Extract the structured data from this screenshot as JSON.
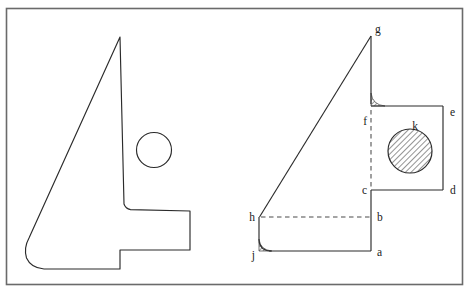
{
  "figure": {
    "kind": "engineering-drawing",
    "title": "",
    "caption": "",
    "frame": {
      "stroke": "#555555",
      "x": 6,
      "y": 8,
      "width": 457,
      "height": 277
    },
    "line_color": "#2b2b2b",
    "hatch_color": "#3a3a3a",
    "background": "#ffffff"
  },
  "pictorial_view": {
    "name": "left-isometric-part",
    "outline_points": "120,37 124,204 129,208 137,210 190,211 190,250 120,250 120,269 44,269 34,266 27,258 25,248 25,238 31,229",
    "hole": {
      "label": "",
      "cx": 154,
      "cy": 150,
      "r": 17,
      "filled": false
    }
  },
  "orthographic_view": {
    "name": "right-profile-view",
    "solid_outline_points": "371,36 371,106 443,106 443,190 371,190 371,251 271,251",
    "ramp_points": "371,36 259,218",
    "dashed_vertical": {
      "x": 371,
      "y1": 106,
      "y2": 190
    },
    "dashed_horizontal": {
      "y": 217,
      "x1": 259,
      "x2": 371
    },
    "left_wall": {
      "x": 259,
      "y1": 217,
      "y2": 243
    },
    "bottom_edge": {
      "y": 251,
      "x1": 271,
      "x2": 371
    },
    "hole": {
      "cx": 410,
      "cy": 151,
      "r": 22,
      "filled": true,
      "fill_pattern": "diagonal-hatch"
    },
    "fillets": [
      {
        "name": "fillet-f",
        "corner_x": 371,
        "corner_y": 106,
        "radius": 13,
        "sweep": "upper-left",
        "hatched": true
      },
      {
        "name": "fillet-j",
        "corner_x": 259,
        "corner_y": 251,
        "radius": 12,
        "sweep": "lower-left",
        "hatched": true
      }
    ],
    "labels": [
      {
        "id": "g",
        "text": "g",
        "x": 375,
        "y": 33,
        "anchor": "start"
      },
      {
        "id": "f",
        "text": "f",
        "x": 366,
        "y": 125,
        "anchor": "end"
      },
      {
        "id": "e",
        "text": "e",
        "x": 450,
        "y": 116,
        "anchor": "start"
      },
      {
        "id": "k",
        "text": "k",
        "x": 415,
        "y": 129,
        "anchor": "middle"
      },
      {
        "id": "c",
        "text": "c",
        "x": 366,
        "y": 194,
        "anchor": "end"
      },
      {
        "id": "d",
        "text": "d",
        "x": 450,
        "y": 194,
        "anchor": "start"
      },
      {
        "id": "h",
        "text": "h",
        "x": 254,
        "y": 221,
        "anchor": "end"
      },
      {
        "id": "b",
        "text": "b",
        "x": 377,
        "y": 221,
        "anchor": "start"
      },
      {
        "id": "j",
        "text": "j",
        "x": 254,
        "y": 259,
        "anchor": "end"
      },
      {
        "id": "a",
        "text": "a",
        "x": 377,
        "y": 256,
        "anchor": "start"
      }
    ]
  }
}
